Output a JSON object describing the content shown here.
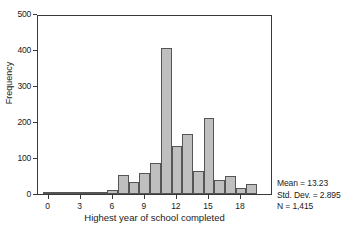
{
  "chart_data": {
    "type": "bar",
    "title": "",
    "xlabel": "Highest year of school completed",
    "ylabel": "Frequency",
    "xlim": [
      -1,
      21
    ],
    "ylim": [
      0,
      500
    ],
    "grid": false,
    "legend": null,
    "bar_width": 1,
    "x_ticks": [
      0,
      3,
      6,
      9,
      12,
      15,
      18
    ],
    "y_ticks": [
      0,
      100,
      200,
      300,
      400,
      500
    ],
    "categories": [
      0,
      1,
      2,
      3,
      4,
      5,
      6,
      7,
      8,
      9,
      10,
      11,
      12,
      13,
      14,
      15,
      16,
      17,
      18,
      19,
      20
    ],
    "values": [
      2,
      1,
      2,
      2,
      3,
      4,
      10,
      52,
      34,
      58,
      86,
      405,
      134,
      167,
      63,
      210,
      39,
      50,
      18,
      29,
      0
    ],
    "series": [
      {
        "name": "Frequency",
        "values": [
          2,
          1,
          2,
          2,
          3,
          4,
          10,
          52,
          34,
          58,
          86,
          405,
          134,
          167,
          63,
          210,
          39,
          50,
          18,
          29,
          0
        ]
      }
    ],
    "annotations": {
      "mean": "Mean = 13.23",
      "std_dev": "Std. Dev. = 2.895",
      "n": "N = 1,415"
    },
    "colors": {
      "bar_fill": "#bfbfbf",
      "bar_edge": "#555555",
      "axis": "#3a3a3a",
      "text": "#1a1a1a",
      "background": "#ffffff"
    }
  },
  "axis": {
    "y_tick_labels": [
      "0",
      "100",
      "200",
      "300",
      "400",
      "500"
    ],
    "x_tick_labels": [
      "0",
      "3",
      "6",
      "9",
      "12",
      "15",
      "18"
    ],
    "y_title": "Frequency",
    "x_title": "Highest year of school completed"
  },
  "stats": {
    "mean": "Mean = 13.23",
    "std_dev": "Std. Dev. = 2.895",
    "n": "N = 1,415"
  }
}
